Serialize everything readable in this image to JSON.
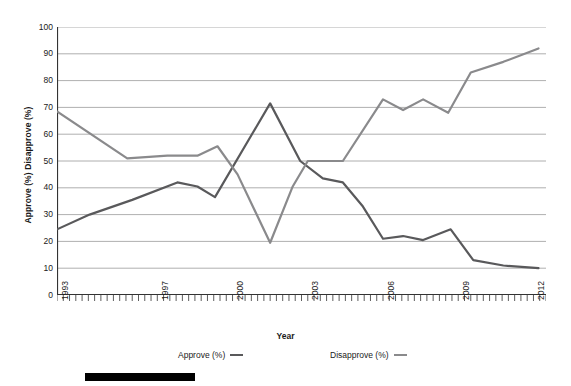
{
  "chart_data": {
    "type": "line",
    "title": "",
    "xlabel": "Year",
    "ylabel": "Approve (%) Disapprove (%)",
    "xlim": [
      1993,
      2012.5
    ],
    "ylim": [
      0,
      100
    ],
    "grid": "horizontal",
    "legend_position": "bottom",
    "y_ticks": [
      0,
      10,
      20,
      30,
      40,
      50,
      60,
      70,
      80,
      90,
      100
    ],
    "x_ticks": [
      1993,
      1997,
      2000,
      2003,
      2006,
      2009,
      2012
    ],
    "x_minor_tick_interval": 0.25,
    "series": [
      {
        "name": "Approve (%)",
        "color": "#59595b",
        "points": [
          {
            "x": 1993.0,
            "y": 24.5
          },
          {
            "x": 1994.3,
            "y": 30.0
          },
          {
            "x": 1996.0,
            "y": 35.5
          },
          {
            "x": 1997.8,
            "y": 42.0
          },
          {
            "x": 1998.6,
            "y": 40.5
          },
          {
            "x": 1999.3,
            "y": 36.5
          },
          {
            "x": 2001.5,
            "y": 71.5
          },
          {
            "x": 2002.7,
            "y": 50.0
          },
          {
            "x": 2003.6,
            "y": 43.5
          },
          {
            "x": 2004.4,
            "y": 42.0
          },
          {
            "x": 2005.2,
            "y": 33.0
          },
          {
            "x": 2006.0,
            "y": 21.0
          },
          {
            "x": 2006.8,
            "y": 22.0
          },
          {
            "x": 2007.6,
            "y": 20.5
          },
          {
            "x": 2008.7,
            "y": 24.5
          },
          {
            "x": 2009.6,
            "y": 13.0
          },
          {
            "x": 2010.8,
            "y": 11.0
          },
          {
            "x": 2012.2,
            "y": 10.0
          }
        ]
      },
      {
        "name": "Disapprove (%)",
        "color": "#8a8a8c",
        "points": [
          {
            "x": 1993.0,
            "y": 68.5
          },
          {
            "x": 1995.8,
            "y": 51.0
          },
          {
            "x": 1997.4,
            "y": 52.0
          },
          {
            "x": 1998.6,
            "y": 52.0
          },
          {
            "x": 1999.4,
            "y": 55.5
          },
          {
            "x": 2000.2,
            "y": 45.0
          },
          {
            "x": 2001.5,
            "y": 19.5
          },
          {
            "x": 2002.4,
            "y": 40.5
          },
          {
            "x": 2003.0,
            "y": 50.0
          },
          {
            "x": 2004.4,
            "y": 50.0
          },
          {
            "x": 2006.0,
            "y": 73.0
          },
          {
            "x": 2006.8,
            "y": 69.0
          },
          {
            "x": 2007.6,
            "y": 73.0
          },
          {
            "x": 2008.6,
            "y": 68.0
          },
          {
            "x": 2009.5,
            "y": 83.0
          },
          {
            "x": 2010.8,
            "y": 87.0
          },
          {
            "x": 2012.2,
            "y": 92.0
          }
        ]
      }
    ]
  },
  "axes": {
    "y_title": "Approve (%) Disapprove (%)",
    "x_title": "Year",
    "y_tick_labels": [
      "100",
      "90",
      "80",
      "70",
      "60",
      "50",
      "40",
      "30",
      "20",
      "10",
      "0"
    ],
    "x_tick_labels": [
      "1993",
      "1997",
      "2000",
      "2003",
      "2006",
      "2009",
      "2012"
    ]
  },
  "legend": {
    "items": [
      {
        "label": "Approve (%)",
        "color": "#59595b"
      },
      {
        "label": "Disapprove (%)",
        "color": "#8a8a8c"
      }
    ]
  },
  "style": {
    "grid_color": "#9a9a9a",
    "axis_color": "#333333",
    "background": "#ffffff",
    "bottom_bar_color": "#000000"
  }
}
